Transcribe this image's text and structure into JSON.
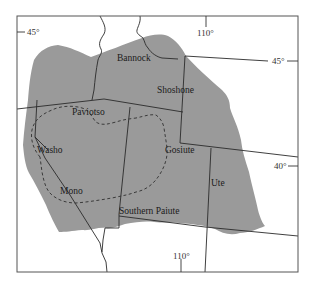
{
  "map": {
    "colors": {
      "region_fill": "#9a9a9a",
      "border": "#2a2a2a",
      "frame": "#555555",
      "background": "#ffffff"
    },
    "frame": {
      "x": 17,
      "y": 16,
      "width": 281,
      "height": 256
    },
    "coordinate_labels": {
      "top_left_45": "45°",
      "top_right_45": "45°",
      "top_110": "110°",
      "right_40": "40°",
      "bottom_110": "110°"
    },
    "tribe_labels": {
      "bannock": "Bannock",
      "shoshone": "Shoshone",
      "paviotso": "Paviotso",
      "washo": "Washo",
      "gosiute": "Gosiute",
      "ute": "Ute",
      "mono": "Mono",
      "southern_paiute": "Southern Paiute"
    }
  }
}
